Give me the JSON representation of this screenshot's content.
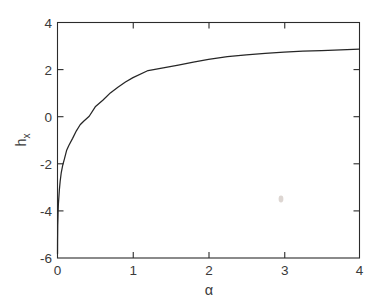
{
  "figure": {
    "background_color": "#ffffff",
    "axes_color": "#2b2b2b",
    "curve_color": "#262626"
  },
  "chart_data": {
    "type": "line",
    "title": "",
    "subtitle": "",
    "xlabel": "α",
    "ylabel": "h_x",
    "ylabel_base": "h",
    "ylabel_subscript": "x",
    "xlim": [
      0,
      4
    ],
    "ylim": [
      -6,
      4
    ],
    "grid": false,
    "legend": null,
    "legend_position": "none",
    "xticks": [
      0,
      1,
      2,
      3,
      4
    ],
    "xtick_labels": [
      "0",
      "1",
      "2",
      "3",
      "4"
    ],
    "yticks": [
      -6,
      -4,
      -2,
      0,
      2,
      4
    ],
    "ytick_labels": [
      "-6",
      "-4",
      "-2",
      "0",
      "2",
      "4"
    ],
    "series": [
      {
        "name": "h_x(α)",
        "color": "#262626",
        "x": [
          0.0003,
          0.0006,
          0.001,
          0.0018,
          0.003,
          0.005,
          0.008,
          0.012,
          0.018,
          0.025,
          0.035,
          0.05,
          0.07,
          0.09,
          0.12,
          0.15,
          0.2,
          0.25,
          0.3,
          0.35,
          0.42,
          0.5,
          0.6,
          0.7,
          0.8,
          0.9,
          1.0,
          1.2,
          1.4,
          1.6,
          1.8,
          2.0,
          2.25,
          2.5,
          2.75,
          3.0,
          3.25,
          3.5,
          3.75,
          4.0
        ],
        "y": [
          -5.82,
          -5.5,
          -5.21,
          -5.0,
          -4.62,
          -4.4,
          -4.03,
          -3.69,
          -3.42,
          -3.09,
          -2.75,
          -2.37,
          -2.05,
          -1.81,
          -1.44,
          -1.22,
          -0.92,
          -0.6,
          -0.34,
          -0.18,
          0.02,
          0.42,
          0.7,
          1.01,
          1.25,
          1.47,
          1.66,
          1.96,
          2.07,
          2.19,
          2.32,
          2.43,
          2.55,
          2.63,
          2.69,
          2.74,
          2.78,
          2.81,
          2.84,
          2.87
        ]
      }
    ]
  }
}
